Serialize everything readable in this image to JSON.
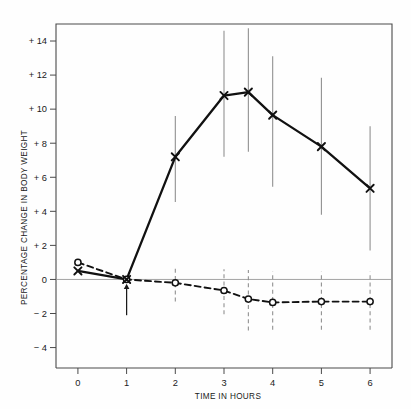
{
  "chart_data": {
    "type": "line",
    "title": "",
    "xlabel": "TIME IN HOURS",
    "ylabel": "PERCENTAGE CHANGE IN BODY WEIGHT",
    "xlim": [
      -0.45,
      6.45
    ],
    "ylim": [
      -5.2,
      15.0
    ],
    "xticks": [
      0,
      1,
      2,
      3,
      4,
      5,
      6
    ],
    "xtick_labels": [
      "0",
      "1",
      "2",
      "3",
      "4",
      "5",
      "6"
    ],
    "yticks": [
      -4,
      -2,
      0,
      2,
      4,
      6,
      8,
      10,
      12,
      14
    ],
    "ytick_labels": [
      "− 4",
      "− 2",
      "0",
      "+ 2",
      "+ 4",
      "+ 6",
      "+ 8",
      "+ 10",
      "+ 12",
      "+ 14"
    ],
    "grid": false,
    "legend": "none",
    "zero_line": 0,
    "annotations": [
      {
        "name": "treatment-arrow",
        "type": "arrow-up",
        "x": 1,
        "y_from": -2.1,
        "y_to": -0.25
      }
    ],
    "series": [
      {
        "name": "experimental",
        "marker": "x",
        "line_style": "solid",
        "error_bar_style": "solid",
        "color": "#111111",
        "x": [
          0,
          1,
          2,
          3,
          3.5,
          4,
          5,
          6
        ],
        "values": [
          0.5,
          0.0,
          7.2,
          10.8,
          11.0,
          9.65,
          7.8,
          5.35
        ],
        "err_low": [
          0.5,
          0.0,
          4.55,
          7.2,
          7.5,
          5.45,
          3.8,
          1.7
        ],
        "err_high": [
          0.5,
          0.0,
          9.6,
          14.6,
          14.75,
          13.1,
          11.85,
          9.0
        ]
      },
      {
        "name": "control",
        "marker": "o",
        "line_style": "dashed",
        "error_bar_style": "dashed",
        "color": "#111111",
        "x": [
          0,
          1,
          2,
          3,
          3.5,
          4,
          5,
          6
        ],
        "values": [
          1.0,
          0.0,
          -0.2,
          -0.65,
          -1.15,
          -1.35,
          -1.3,
          -1.3
        ],
        "err_low": [
          1.0,
          0.0,
          -1.3,
          -2.05,
          -3.0,
          -2.95,
          -2.95,
          -2.95
        ],
        "err_high": [
          1.0,
          0.0,
          0.75,
          0.6,
          0.55,
          0.45,
          0.45,
          0.45
        ]
      }
    ]
  }
}
